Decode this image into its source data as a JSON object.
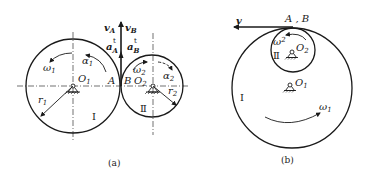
{
  "figure_a": {
    "caption": "(a)",
    "gear1": {
      "roman": "Ⅰ",
      "center": "O",
      "center_sub": "1",
      "radius": "r",
      "radius_sub": "1",
      "omega": "ω",
      "omega_sub": "1",
      "alpha": "α",
      "alpha_sub": "1"
    },
    "gear2": {
      "roman": "Ⅱ",
      "center": "O",
      "center_sub": "2",
      "radius": "r",
      "radius_sub": "2",
      "omega": "ω",
      "omega_sub": "2",
      "alpha": "α",
      "alpha_sub": "2"
    },
    "point_a": "A",
    "point_b": "B",
    "v_a": "v",
    "v_a_sub": "A",
    "v_b": "v",
    "v_b_sub": "B",
    "a_a": "a",
    "a_a_sub": "A",
    "a_a_sup": "t",
    "a_b": "a",
    "a_b_sub": "B",
    "a_b_sup": "t"
  },
  "figure_b": {
    "caption": "(b)",
    "velocity": "v",
    "contact": "A , B",
    "gear1": {
      "roman": "Ⅰ",
      "center": "O",
      "center_sub": "1",
      "omega": "ω",
      "omega_sub": "1"
    },
    "gear2": {
      "roman": "Ⅱ",
      "center": "O",
      "center_sub": "2",
      "omega": "ω",
      "omega_sub": "2"
    }
  }
}
